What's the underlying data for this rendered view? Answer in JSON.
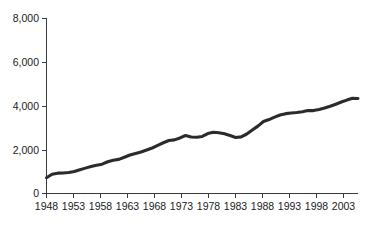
{
  "chart_data": {
    "type": "line",
    "title": "",
    "subtitle": "",
    "xlabel": "",
    "ylabel": "",
    "xlim": [
      1948,
      2004
    ],
    "ylim": [
      0,
      8000
    ],
    "grid": false,
    "legend": null,
    "legend_position": "none",
    "series_color": "#2b2b2b",
    "y_ticks": [
      0,
      2000,
      4000,
      6000,
      8000
    ],
    "y_tick_labels": [
      "0",
      "2,000",
      "4,000",
      "6,000",
      "8,000"
    ],
    "x_ticks": [
      1948,
      1953,
      1958,
      1963,
      1968,
      1973,
      1978,
      1983,
      1988,
      1993,
      1998,
      2003
    ],
    "x_tick_labels": [
      "1948",
      "1953",
      "1958",
      "1963",
      "1968",
      "1973",
      "1978",
      "1983",
      "1988",
      "1993",
      "1998",
      "2003"
    ],
    "x": [
      1948,
      1949,
      1950,
      1951,
      1952,
      1953,
      1954,
      1955,
      1956,
      1957,
      1958,
      1959,
      1960,
      1961,
      1962,
      1963,
      1964,
      1965,
      1966,
      1967,
      1968,
      1969,
      1970,
      1971,
      1972,
      1973,
      1974,
      1975,
      1976,
      1977,
      1978,
      1979,
      1980,
      1981,
      1982,
      1983,
      1984,
      1985,
      1986,
      1987,
      1988,
      1989,
      1990,
      1991,
      1992,
      1993,
      1994,
      1995,
      1996,
      1997,
      1998,
      1999,
      2000,
      2001,
      2002,
      2003,
      2004
    ],
    "values": [
      720,
      880,
      930,
      940,
      960,
      1010,
      1090,
      1160,
      1230,
      1290,
      1340,
      1450,
      1520,
      1560,
      1660,
      1760,
      1830,
      1900,
      1990,
      2080,
      2200,
      2320,
      2420,
      2450,
      2540,
      2650,
      2580,
      2570,
      2610,
      2740,
      2800,
      2780,
      2730,
      2650,
      2560,
      2590,
      2720,
      2900,
      3080,
      3290,
      3380,
      3490,
      3590,
      3650,
      3680,
      3700,
      3740,
      3790,
      3790,
      3840,
      3910,
      3990,
      4080,
      4180,
      4270,
      4350,
      4340
    ],
    "annotations": []
  },
  "axes": {
    "y_axis_name": "value-axis",
    "x_axis_name": "year-axis"
  }
}
